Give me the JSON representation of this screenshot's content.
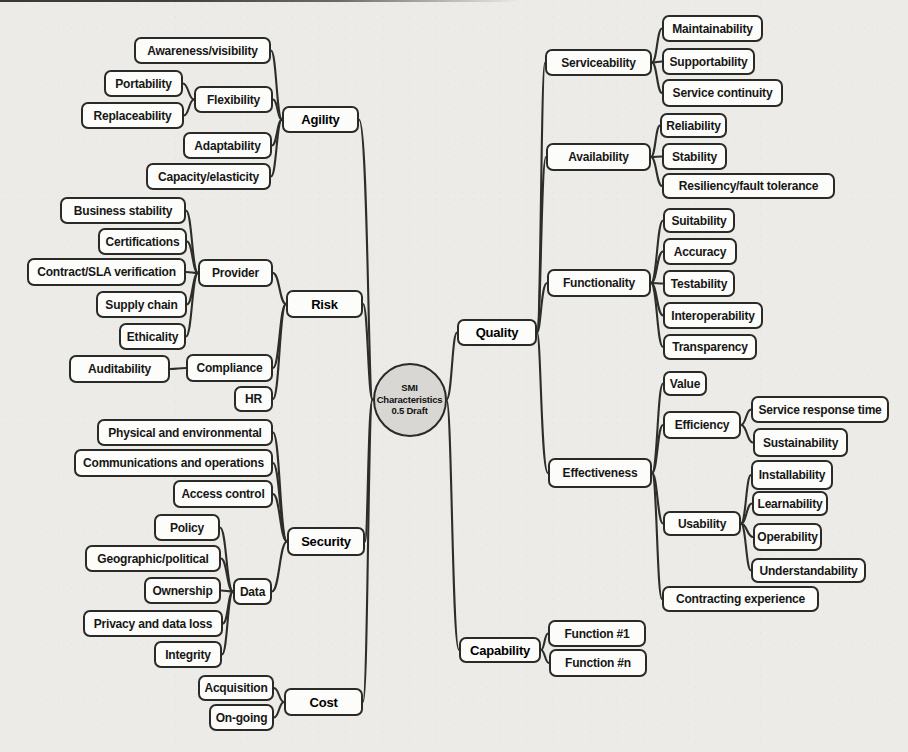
{
  "colors": {
    "paper": "#edebe7",
    "box_background": "#fcfcfa",
    "box_border": "#2a2a27",
    "connector_line": "#2d2d2a",
    "center_circle_fill": "#d8d7d3"
  },
  "center": {
    "lines": [
      "SMI",
      "Characteristics",
      "0.5 Draft"
    ],
    "cx": 409.5,
    "cy": 399.5,
    "r": 37
  },
  "nodes": [
    {
      "id": "agility",
      "label": "Agility",
      "x": 282,
      "y": 106,
      "w": 77,
      "h": 27,
      "main": true
    },
    {
      "id": "awareness",
      "label": "Awareness/visibility",
      "x": 134,
      "y": 37,
      "w": 137,
      "h": 27
    },
    {
      "id": "portability",
      "label": "Portability",
      "x": 104,
      "y": 70,
      "w": 79,
      "h": 27
    },
    {
      "id": "flexibility",
      "label": "Flexibility",
      "x": 194,
      "y": 86,
      "w": 79,
      "h": 27
    },
    {
      "id": "replaceability",
      "label": "Replaceability",
      "x": 81,
      "y": 102,
      "w": 103,
      "h": 27
    },
    {
      "id": "adaptability",
      "label": "Adaptability",
      "x": 183,
      "y": 132,
      "w": 89,
      "h": 27
    },
    {
      "id": "capacity",
      "label": "Capacity/elasticity",
      "x": 146,
      "y": 163,
      "w": 125,
      "h": 27
    },
    {
      "id": "risk",
      "label": "Risk",
      "x": 286,
      "y": 290,
      "w": 77,
      "h": 28,
      "main": true
    },
    {
      "id": "business_stability",
      "label": "Business stability",
      "x": 60,
      "y": 197,
      "w": 126,
      "h": 27
    },
    {
      "id": "certifications",
      "label": "Certifications",
      "x": 98,
      "y": 228,
      "w": 89,
      "h": 27
    },
    {
      "id": "contract_sla",
      "label": "Contract/SLA verification",
      "x": 27,
      "y": 258,
      "w": 159,
      "h": 28
    },
    {
      "id": "provider",
      "label": "Provider",
      "x": 198,
      "y": 259,
      "w": 75,
      "h": 28
    },
    {
      "id": "supply_chain",
      "label": "Supply chain",
      "x": 96,
      "y": 291,
      "w": 91,
      "h": 27
    },
    {
      "id": "ethicality",
      "label": "Ethicality",
      "x": 119,
      "y": 323,
      "w": 67,
      "h": 27
    },
    {
      "id": "auditability",
      "label": "Auditability",
      "x": 69,
      "y": 355,
      "w": 101,
      "h": 28
    },
    {
      "id": "compliance",
      "label": "Compliance",
      "x": 186,
      "y": 354,
      "w": 87,
      "h": 28
    },
    {
      "id": "hr",
      "label": "HR",
      "x": 234,
      "y": 386,
      "w": 39,
      "h": 26
    },
    {
      "id": "security",
      "label": "Security",
      "x": 287,
      "y": 527,
      "w": 78,
      "h": 29,
      "main": true
    },
    {
      "id": "physical",
      "label": "Physical and environmental",
      "x": 97,
      "y": 419,
      "w": 176,
      "h": 27
    },
    {
      "id": "communications",
      "label": "Communications and operations",
      "x": 74,
      "y": 449,
      "w": 199,
      "h": 28
    },
    {
      "id": "access_control",
      "label": "Access control",
      "x": 173,
      "y": 480,
      "w": 100,
      "h": 28
    },
    {
      "id": "policy",
      "label": "Policy",
      "x": 154,
      "y": 514,
      "w": 66,
      "h": 27
    },
    {
      "id": "geographic",
      "label": "Geographic/political",
      "x": 85,
      "y": 545,
      "w": 136,
      "h": 27
    },
    {
      "id": "ownership",
      "label": "Ownership",
      "x": 144,
      "y": 577,
      "w": 77,
      "h": 27
    },
    {
      "id": "data",
      "label": "Data",
      "x": 233,
      "y": 578,
      "w": 39,
      "h": 27
    },
    {
      "id": "privacy",
      "label": "Privacy and data loss",
      "x": 83,
      "y": 610,
      "w": 140,
      "h": 27
    },
    {
      "id": "integrity",
      "label": "Integrity",
      "x": 154,
      "y": 641,
      "w": 68,
      "h": 27
    },
    {
      "id": "cost",
      "label": "Cost",
      "x": 284,
      "y": 688,
      "w": 79,
      "h": 28,
      "main": true
    },
    {
      "id": "acquisition",
      "label": "Acquisition",
      "x": 198,
      "y": 675,
      "w": 76,
      "h": 26
    },
    {
      "id": "ongoing",
      "label": "On-going",
      "x": 209,
      "y": 704,
      "w": 65,
      "h": 27
    },
    {
      "id": "quality",
      "label": "Quality",
      "x": 457,
      "y": 319,
      "w": 80,
      "h": 27,
      "main": true
    },
    {
      "id": "serviceability",
      "label": "Serviceability",
      "x": 545,
      "y": 49,
      "w": 107,
      "h": 27
    },
    {
      "id": "maintainability",
      "label": "Maintainability",
      "x": 662,
      "y": 15,
      "w": 101,
      "h": 27
    },
    {
      "id": "supportability",
      "label": "Supportability",
      "x": 662,
      "y": 48,
      "w": 93,
      "h": 27
    },
    {
      "id": "service_continuity",
      "label": "Service continuity",
      "x": 662,
      "y": 79,
      "w": 121,
      "h": 28
    },
    {
      "id": "availability",
      "label": "Availability",
      "x": 546,
      "y": 143,
      "w": 105,
      "h": 28
    },
    {
      "id": "reliability",
      "label": "Reliability",
      "x": 660,
      "y": 113,
      "w": 67,
      "h": 25
    },
    {
      "id": "stability",
      "label": "Stability",
      "x": 662,
      "y": 143,
      "w": 65,
      "h": 27
    },
    {
      "id": "resiliency",
      "label": "Resiliency/fault tolerance",
      "x": 662,
      "y": 173,
      "w": 173,
      "h": 26
    },
    {
      "id": "functionality",
      "label": "Functionality",
      "x": 547,
      "y": 269,
      "w": 104,
      "h": 28
    },
    {
      "id": "suitability",
      "label": "Suitability",
      "x": 663,
      "y": 208,
      "w": 72,
      "h": 25
    },
    {
      "id": "accuracy",
      "label": "Accuracy",
      "x": 663,
      "y": 238,
      "w": 74,
      "h": 27
    },
    {
      "id": "testability",
      "label": "Testability",
      "x": 663,
      "y": 270,
      "w": 72,
      "h": 27
    },
    {
      "id": "interoperability",
      "label": "Interoperability",
      "x": 663,
      "y": 302,
      "w": 100,
      "h": 27
    },
    {
      "id": "transparency",
      "label": "Transparency",
      "x": 663,
      "y": 334,
      "w": 94,
      "h": 26
    },
    {
      "id": "effectiveness",
      "label": "Effectiveness",
      "x": 548,
      "y": 458,
      "w": 104,
      "h": 30
    },
    {
      "id": "value",
      "label": "Value",
      "x": 663,
      "y": 371,
      "w": 44,
      "h": 25
    },
    {
      "id": "efficiency",
      "label": "Efficiency",
      "x": 663,
      "y": 411,
      "w": 78,
      "h": 28
    },
    {
      "id": "srt",
      "label": "Service response time",
      "x": 751,
      "y": 396,
      "w": 138,
      "h": 27
    },
    {
      "id": "sustainability",
      "label": "Sustainability",
      "x": 753,
      "y": 428,
      "w": 95,
      "h": 29
    },
    {
      "id": "usability",
      "label": "Usability",
      "x": 663,
      "y": 511,
      "w": 78,
      "h": 25
    },
    {
      "id": "installability",
      "label": "Installability",
      "x": 751,
      "y": 460,
      "w": 82,
      "h": 30
    },
    {
      "id": "learnability",
      "label": "Learnability",
      "x": 752,
      "y": 491,
      "w": 76,
      "h": 25
    },
    {
      "id": "operability",
      "label": "Operability",
      "x": 753,
      "y": 523,
      "w": 69,
      "h": 28
    },
    {
      "id": "understandability",
      "label": "Understandability",
      "x": 751,
      "y": 558,
      "w": 115,
      "h": 25
    },
    {
      "id": "contracting",
      "label": "Contracting experience",
      "x": 662,
      "y": 586,
      "w": 157,
      "h": 26
    },
    {
      "id": "capability",
      "label": "Capability",
      "x": 459,
      "y": 637,
      "w": 82,
      "h": 26,
      "main": true
    },
    {
      "id": "function_1",
      "label": "Function #1",
      "x": 548,
      "y": 620,
      "w": 98,
      "h": 27
    },
    {
      "id": "function_n",
      "label": "Function #n",
      "x": 549,
      "y": 649,
      "w": 98,
      "h": 28
    }
  ],
  "edges": [
    {
      "f": "portability",
      "t": "flexibility"
    },
    {
      "f": "replaceability",
      "t": "flexibility"
    },
    {
      "f": "awareness",
      "t": "agility"
    },
    {
      "f": "flexibility",
      "t": "agility"
    },
    {
      "f": "adaptability",
      "t": "agility"
    },
    {
      "f": "capacity",
      "t": "agility"
    },
    {
      "f": "business_stability",
      "t": "provider"
    },
    {
      "f": "certifications",
      "t": "provider"
    },
    {
      "f": "contract_sla",
      "t": "provider"
    },
    {
      "f": "supply_chain",
      "t": "provider"
    },
    {
      "f": "ethicality",
      "t": "provider"
    },
    {
      "f": "auditability",
      "t": "compliance"
    },
    {
      "f": "provider",
      "t": "risk"
    },
    {
      "f": "compliance",
      "t": "risk"
    },
    {
      "f": "hr",
      "t": "risk"
    },
    {
      "f": "physical",
      "t": "security"
    },
    {
      "f": "communications",
      "t": "security"
    },
    {
      "f": "access_control",
      "t": "security"
    },
    {
      "f": "data",
      "t": "security"
    },
    {
      "f": "policy",
      "t": "data"
    },
    {
      "f": "geographic",
      "t": "data"
    },
    {
      "f": "ownership",
      "t": "data"
    },
    {
      "f": "privacy",
      "t": "data"
    },
    {
      "f": "integrity",
      "t": "data"
    },
    {
      "f": "acquisition",
      "t": "cost"
    },
    {
      "f": "ongoing",
      "t": "cost"
    },
    {
      "f": "agility",
      "t": "center",
      "j": 368
    },
    {
      "f": "risk",
      "t": "center",
      "j": 368
    },
    {
      "f": "security",
      "t": "center",
      "j": 368
    },
    {
      "f": "cost",
      "t": "center",
      "j": 368
    },
    {
      "f": "center",
      "t": "quality",
      "j": 452
    },
    {
      "f": "center",
      "t": "capability",
      "j": 452
    },
    {
      "f": "quality",
      "t": "serviceability",
      "j": 541
    },
    {
      "f": "quality",
      "t": "availability",
      "j": 541
    },
    {
      "f": "quality",
      "t": "functionality",
      "j": 541
    },
    {
      "f": "quality",
      "t": "effectiveness",
      "j": 541
    },
    {
      "f": "serviceability",
      "t": "maintainability"
    },
    {
      "f": "serviceability",
      "t": "supportability"
    },
    {
      "f": "serviceability",
      "t": "service_continuity"
    },
    {
      "f": "availability",
      "t": "reliability"
    },
    {
      "f": "availability",
      "t": "stability"
    },
    {
      "f": "availability",
      "t": "resiliency"
    },
    {
      "f": "functionality",
      "t": "suitability"
    },
    {
      "f": "functionality",
      "t": "accuracy"
    },
    {
      "f": "functionality",
      "t": "testability"
    },
    {
      "f": "functionality",
      "t": "interoperability"
    },
    {
      "f": "functionality",
      "t": "transparency"
    },
    {
      "f": "effectiveness",
      "t": "value"
    },
    {
      "f": "effectiveness",
      "t": "efficiency"
    },
    {
      "f": "effectiveness",
      "t": "usability"
    },
    {
      "f": "effectiveness",
      "t": "contracting"
    },
    {
      "f": "efficiency",
      "t": "srt"
    },
    {
      "f": "efficiency",
      "t": "sustainability"
    },
    {
      "f": "usability",
      "t": "installability"
    },
    {
      "f": "usability",
      "t": "learnability"
    },
    {
      "f": "usability",
      "t": "operability"
    },
    {
      "f": "usability",
      "t": "understandability"
    },
    {
      "f": "capability",
      "t": "function_1"
    },
    {
      "f": "capability",
      "t": "function_n"
    }
  ]
}
